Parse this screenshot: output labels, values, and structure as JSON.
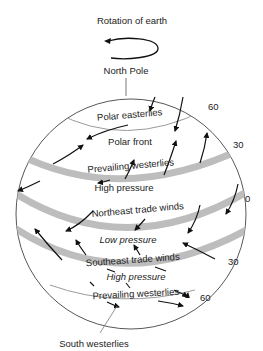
{
  "diagram": {
    "title": "Rotation of earth",
    "north_pole_label": "North Pole",
    "south_label": "South westerlies",
    "latitudes": {
      "n60": "60",
      "n30": "30",
      "eq": "0",
      "s30": "30",
      "s60": "60"
    },
    "zones": {
      "polar_easterlies": "Polar easterlies",
      "polar_front": "Polar front",
      "prevailing_westerlies_n": "Prevailing westerlies",
      "high_pressure_n": "High pressure",
      "ne_trade_winds": "Northeast trade winds",
      "low_pressure": "Low pressure",
      "se_trade_winds": "Southeast trade winds",
      "high_pressure_s": "High pressure",
      "prevailing_westerlies_s": "Prevailing westerlies"
    },
    "colors": {
      "band": "#bdbdbd",
      "line": "#555555",
      "arrow": "#111111"
    }
  }
}
